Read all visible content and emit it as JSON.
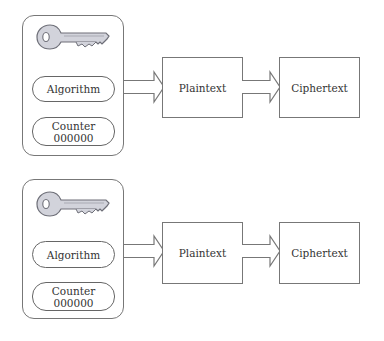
{
  "diagram": {
    "groups": [
      {
        "key_icon": "key-icon",
        "algorithm_label": "Algorithm",
        "counter_label": "Counter",
        "counter_value": "000000",
        "plaintext_label": "Plaintext",
        "ciphertext_label": "Ciphertext"
      },
      {
        "key_icon": "key-icon",
        "algorithm_label": "Algorithm",
        "counter_label": "Counter",
        "counter_value": "000000",
        "plaintext_label": "Plaintext",
        "ciphertext_label": "Ciphertext"
      }
    ],
    "colors": {
      "stroke": "#777777",
      "text": "#333333",
      "key_fill": "#d2d3db",
      "key_stroke": "#6e6f78",
      "background": "#ffffff"
    }
  }
}
